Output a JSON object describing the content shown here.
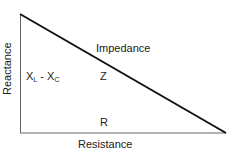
{
  "diagram": {
    "labels": {
      "y_axis": "Reactance",
      "x_axis": "Resistance",
      "hypotenuse": "Impedance",
      "hypotenuse_symbol": "Z",
      "opposite_base": "X",
      "opposite_sub_l": "L",
      "opposite_minus": " - ",
      "opposite_sub_c": "C",
      "adjacent_symbol": "R"
    },
    "colors": {
      "hypotenuse": "#111111",
      "legs": "#666666",
      "text": "#222222"
    }
  }
}
